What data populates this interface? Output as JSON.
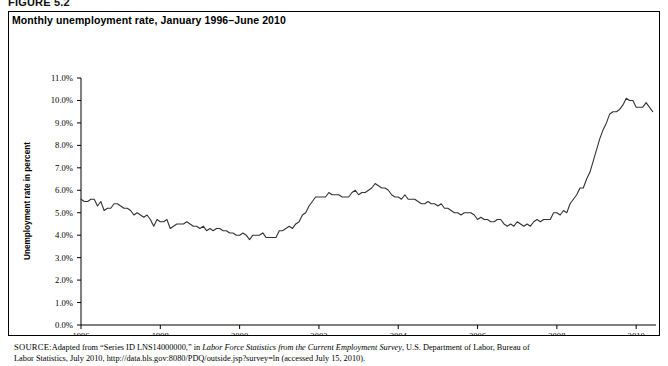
{
  "figure": {
    "label": "FIGURE 5.2",
    "title": "Monthly unemployment rate, January 1996–June 2010"
  },
  "source": {
    "prefix": "SOURCE:",
    "line1_a": "Adapted from “Series ID LNS14000000,” in ",
    "line1_italic": "Labor Force Statistics from the Current Employment Survey",
    "line1_b": ", U.S. Department of Labor, Bureau of",
    "line2": "Labor Statistics, July 2010, http://data.bls.gov:8080/PDQ/outside.jsp?survey=ln (accessed July 15, 2010)."
  },
  "chart_data": {
    "type": "line",
    "title": "Monthly unemployment rate, January 1996–June 2010",
    "xlabel": "",
    "ylabel": "Unemployment rate in percent",
    "ylim": [
      0.0,
      11.0
    ],
    "ytick_labels": [
      "0.0%",
      "1.0%",
      "2.0%",
      "3.0%",
      "4.0%",
      "5.0%",
      "6.0%",
      "7.0%",
      "8.0%",
      "9.0%",
      "10.0%",
      "11.0%"
    ],
    "ytick_values": [
      0.0,
      1.0,
      2.0,
      3.0,
      4.0,
      5.0,
      6.0,
      7.0,
      8.0,
      9.0,
      10.0,
      11.0
    ],
    "xlim": [
      1996.0,
      2010.5
    ],
    "xtick_labels": [
      "1996",
      "1998",
      "2000",
      "2002",
      "2004",
      "2006",
      "2008",
      "2010"
    ],
    "xtick_values": [
      1996,
      1998,
      2000,
      2002,
      2004,
      2006,
      2008,
      2010
    ],
    "grid": false,
    "legend": "none",
    "line_color": "#333333",
    "series": [
      {
        "name": "Unemployment rate",
        "x_start": 1996.0,
        "x_step": 0.0833333,
        "values": [
          5.6,
          5.5,
          5.5,
          5.6,
          5.6,
          5.3,
          5.5,
          5.1,
          5.2,
          5.2,
          5.4,
          5.4,
          5.3,
          5.2,
          5.2,
          5.1,
          4.9,
          5.0,
          4.9,
          4.8,
          4.9,
          4.7,
          4.4,
          4.7,
          4.6,
          4.6,
          4.7,
          4.3,
          4.4,
          4.5,
          4.5,
          4.5,
          4.6,
          4.5,
          4.4,
          4.4,
          4.3,
          4.4,
          4.2,
          4.3,
          4.2,
          4.3,
          4.3,
          4.2,
          4.2,
          4.1,
          4.1,
          4.0,
          4.0,
          4.1,
          4.0,
          3.8,
          4.0,
          4.0,
          4.0,
          4.1,
          3.9,
          3.9,
          3.9,
          3.9,
          4.2,
          4.2,
          4.3,
          4.4,
          4.3,
          4.5,
          4.6,
          4.9,
          5.0,
          5.3,
          5.5,
          5.7,
          5.7,
          5.7,
          5.7,
          5.9,
          5.8,
          5.8,
          5.8,
          5.7,
          5.7,
          5.7,
          5.9,
          6.0,
          5.8,
          5.9,
          5.9,
          6.0,
          6.1,
          6.3,
          6.2,
          6.1,
          6.1,
          6.0,
          5.8,
          5.7,
          5.7,
          5.6,
          5.8,
          5.6,
          5.6,
          5.6,
          5.5,
          5.4,
          5.4,
          5.5,
          5.4,
          5.4,
          5.3,
          5.4,
          5.2,
          5.2,
          5.1,
          5.0,
          5.0,
          4.9,
          5.0,
          5.0,
          5.0,
          4.9,
          4.7,
          4.8,
          4.7,
          4.7,
          4.6,
          4.6,
          4.7,
          4.7,
          4.5,
          4.4,
          4.5,
          4.4,
          4.6,
          4.5,
          4.4,
          4.5,
          4.4,
          4.6,
          4.7,
          4.6,
          4.7,
          4.7,
          4.7,
          5.0,
          5.0,
          4.9,
          5.1,
          5.0,
          5.4,
          5.6,
          5.8,
          6.1,
          6.1,
          6.5,
          6.8,
          7.3,
          7.8,
          8.3,
          8.7,
          9.0,
          9.4,
          9.5,
          9.5,
          9.6,
          9.8,
          10.1,
          10.0,
          10.0,
          9.7,
          9.7,
          9.7,
          9.9,
          9.7,
          9.5
        ]
      }
    ]
  }
}
